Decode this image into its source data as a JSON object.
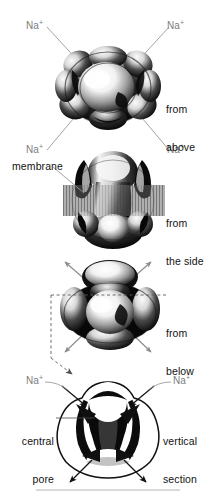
{
  "figure": {
    "ion_label": "Na",
    "ion_charge": "+",
    "accent_gray": "#7d7d7d",
    "text_black": "#121212",
    "membrane_color": "#8e8e8e",
    "background": "#ffffff"
  },
  "panels": [
    {
      "id": "from-above",
      "caption_line1": "from",
      "caption_line2": "above",
      "ion_labels": [
        {
          "id": "na-top-left",
          "text": "Na",
          "charge": "+"
        },
        {
          "id": "na-top-right",
          "text": "Na",
          "charge": "+"
        },
        {
          "id": "na-bottom-left",
          "text": "Na",
          "charge": "+"
        },
        {
          "id": "na-bottom-right",
          "text": "Na",
          "charge": "+"
        }
      ]
    },
    {
      "id": "from-the-side",
      "caption_line1": "from",
      "caption_line2": "the side",
      "membrane_label": "membrane"
    },
    {
      "id": "from-below",
      "caption_line1": "from",
      "caption_line2": "below"
    },
    {
      "id": "vertical-section",
      "caption_line1": "vertical",
      "caption_line2": "section",
      "pore_label_line1": "central",
      "pore_label_line2": "pore",
      "ion_labels": [
        {
          "id": "na-sec-left",
          "text": "Na",
          "charge": "+"
        },
        {
          "id": "na-sec-right",
          "text": "Na",
          "charge": "+"
        }
      ]
    }
  ]
}
